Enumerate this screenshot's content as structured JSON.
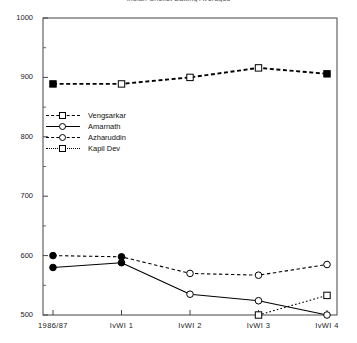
{
  "chart_data": {
    "type": "line",
    "title": "Indian Cricket Batting Averages",
    "xlabel": "",
    "ylabel": "",
    "categories": [
      "1986/87",
      "IvWI 1",
      "IvWI 2",
      "IvWI 3",
      "IvWI 4"
    ],
    "ylim": [
      500,
      1000
    ],
    "yticks": [
      500,
      600,
      700,
      800,
      900,
      1000
    ],
    "ytick_labels": [
      "500",
      "600",
      "700",
      "800",
      "900",
      "1000"
    ],
    "yminor": [
      550,
      650,
      750,
      850,
      950
    ],
    "grid": false,
    "legend_position": "upper-left-inside",
    "series": [
      {
        "name": "Vengsarkar",
        "line": "dashed-thick",
        "marker": "square",
        "values": [
          889,
          889,
          900,
          916,
          906
        ],
        "filled_points": [
          true,
          false,
          false,
          false,
          true
        ]
      },
      {
        "name": "Amarnath",
        "line": "solid",
        "marker": "circle",
        "values": [
          580,
          588,
          535,
          524,
          500
        ],
        "filled_points": [
          true,
          true,
          false,
          false,
          false
        ]
      },
      {
        "name": "Azharuddin",
        "line": "dashed",
        "marker": "circle",
        "values": [
          600,
          598,
          570,
          567,
          585
        ],
        "filled_points": [
          true,
          true,
          false,
          false,
          false
        ]
      },
      {
        "name": "Kapil Dev",
        "line": "dotted",
        "marker": "square",
        "values": [
          null,
          null,
          null,
          500,
          533
        ],
        "filled_points": [
          false,
          false,
          false,
          false,
          false
        ]
      }
    ]
  },
  "colors": {
    "axis": "#444444",
    "ink": "#000000",
    "background": "#ffffff"
  }
}
